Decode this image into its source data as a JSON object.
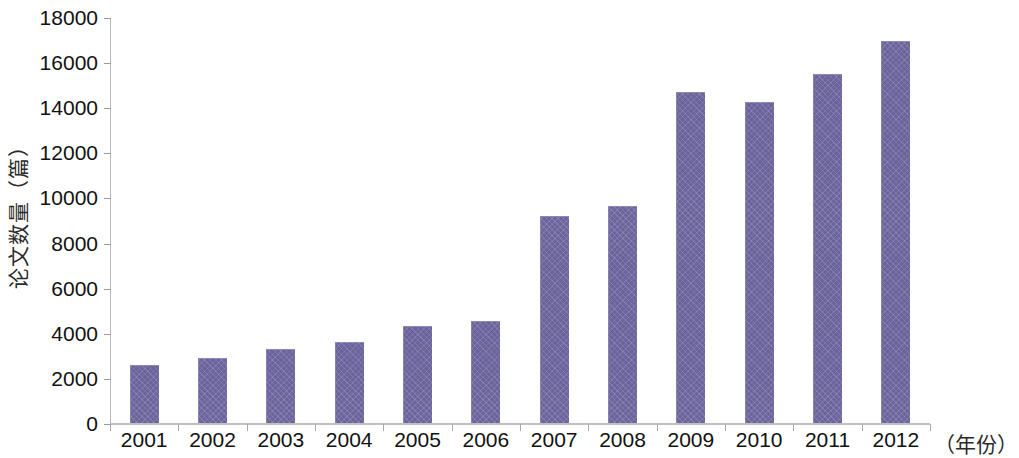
{
  "chart_data": {
    "type": "bar",
    "title": "",
    "subtitle": "",
    "xlabel": "（年份）",
    "ylabel": "论文数量（篇）",
    "categories": [
      "2001",
      "2002",
      "2003",
      "2004",
      "2005",
      "2006",
      "2007",
      "2008",
      "2009",
      "2010",
      "2011",
      "2012"
    ],
    "values": [
      2550,
      2880,
      3280,
      3570,
      4280,
      4540,
      9190,
      9600,
      14670,
      14220,
      15470,
      16930
    ],
    "series": [
      {
        "name": "论文数量",
        "values": [
          2550,
          2880,
          3280,
          3570,
          4280,
          4540,
          9190,
          9600,
          14670,
          14220,
          15470,
          16930
        ]
      }
    ],
    "ylim": [
      0,
      18000
    ],
    "ytick_step": 2000,
    "ytick_labels": [
      "0",
      "2000",
      "4000",
      "6000",
      "8000",
      "10000",
      "12000",
      "14000",
      "16000",
      "18000"
    ],
    "ytick_values": [
      0,
      2000,
      4000,
      6000,
      8000,
      10000,
      12000,
      14000,
      16000,
      18000
    ],
    "grid": false,
    "legend": false,
    "legend_position": "none",
    "bar_color": "#6a639c",
    "bar_edge_color": "#8d88b4",
    "axis_color": "#b9b9b9",
    "background_color": "#ffffff",
    "annotations": []
  }
}
